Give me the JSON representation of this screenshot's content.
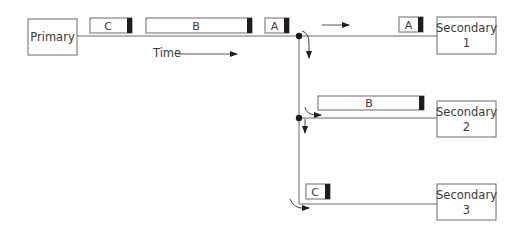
{
  "diagram": {
    "type": "network-replication-flow",
    "colors": {
      "line": "#6b6b6b",
      "box_border": "#6b6b6b",
      "packet_tail": "#1e1e1e",
      "junction": "#1a1a1a",
      "text": "#3a3a3a"
    },
    "nodes": {
      "primary": {
        "label": "Primary"
      },
      "secondary1": {
        "line1": "Secondary",
        "line2": "1"
      },
      "secondary2": {
        "line1": "Secondary",
        "line2": "2"
      },
      "secondary3": {
        "line1": "Secondary",
        "line2": "3"
      }
    },
    "packets": {
      "primary_line": [
        {
          "label": "C"
        },
        {
          "label": "B"
        },
        {
          "label": "A"
        }
      ],
      "to_secondary1": {
        "label": "A"
      },
      "to_secondary2": {
        "label": "B"
      },
      "to_secondary3": {
        "label": "C"
      }
    },
    "time_label": "Time"
  }
}
